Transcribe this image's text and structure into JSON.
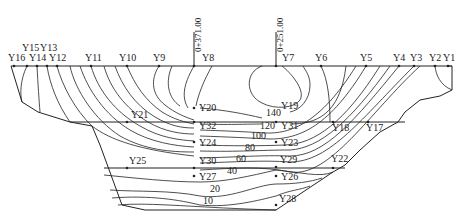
{
  "diagram": {
    "type": "contour cross-section",
    "stations": [
      {
        "label": "0+371.00",
        "x": 194
      },
      {
        "label": "0+251.00",
        "x": 276
      }
    ],
    "top_points": [
      {
        "label": "Y16",
        "x": 14
      },
      {
        "label": "Y15",
        "x": 27
      },
      {
        "label": "Y14",
        "x": 37
      },
      {
        "label": "Y13",
        "x": 47
      },
      {
        "label": "Y12",
        "x": 57
      },
      {
        "label": "Y11",
        "x": 91
      },
      {
        "label": "Y10",
        "x": 127
      },
      {
        "label": "Y9",
        "x": 159
      },
      {
        "label": "Y8",
        "x": 194
      },
      {
        "label": "Y7",
        "x": 276
      },
      {
        "label": "Y6",
        "x": 321
      },
      {
        "label": "Y5",
        "x": 366
      },
      {
        "label": "Y4",
        "x": 399
      },
      {
        "label": "Y3",
        "x": 414
      },
      {
        "label": "Y2",
        "x": 435
      },
      {
        "label": "Y1",
        "x": 448
      }
    ],
    "inner_points": [
      {
        "label": "Y21",
        "x": 127,
        "y": 122
      },
      {
        "label": "Y20",
        "x": 194,
        "y": 108
      },
      {
        "label": "Y19",
        "x": 276,
        "y": 108
      },
      {
        "label": "Y32",
        "x": 194,
        "y": 124
      },
      {
        "label": "Y31",
        "x": 276,
        "y": 124
      },
      {
        "label": "Y18",
        "x": 333,
        "y": 122
      },
      {
        "label": "Y17",
        "x": 368,
        "y": 122
      },
      {
        "label": "Y24",
        "x": 194,
        "y": 142
      },
      {
        "label": "Y23",
        "x": 276,
        "y": 142
      },
      {
        "label": "Y25",
        "x": 127,
        "y": 168
      },
      {
        "label": "Y30",
        "x": 194,
        "y": 168
      },
      {
        "label": "Y29",
        "x": 276,
        "y": 168
      },
      {
        "label": "Y22",
        "x": 333,
        "y": 168
      },
      {
        "label": "Y27",
        "x": 194,
        "y": 176
      },
      {
        "label": "Y26",
        "x": 276,
        "y": 176
      },
      {
        "label": "Y28",
        "x": 276,
        "y": 205
      }
    ],
    "contour_labels": [
      "140",
      "120",
      "100",
      "80",
      "60",
      "40",
      "20",
      "10"
    ]
  }
}
